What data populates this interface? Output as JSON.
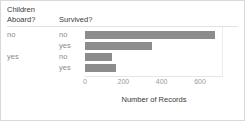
{
  "chart_data": {
    "type": "bar",
    "orientation": "horizontal",
    "title": "",
    "xlabel": "Number of Records",
    "ylabel": "",
    "xlim": [
      0,
      720
    ],
    "grid": false,
    "legend": null,
    "bar_color": "#8c8c8c",
    "group_headers": [
      "Children Aboard?",
      "Survived?"
    ],
    "groups": [
      {
        "group_label": "no",
        "rows": [
          {
            "label": "no",
            "value": 680
          },
          {
            "label": "yes",
            "value": 349
          }
        ]
      },
      {
        "group_label": "yes",
        "rows": [
          {
            "label": "no",
            "value": 141
          },
          {
            "label": "yes",
            "value": 161
          }
        ]
      }
    ],
    "categories": [
      "no / no",
      "no / yes",
      "yes / no",
      "yes / yes"
    ],
    "values": [
      680,
      349,
      141,
      161
    ],
    "ticks": [
      {
        "label": "0",
        "value": 0
      },
      {
        "label": "200",
        "value": 200
      },
      {
        "label": "400",
        "value": 400
      },
      {
        "label": "600",
        "value": 600
      }
    ]
  }
}
